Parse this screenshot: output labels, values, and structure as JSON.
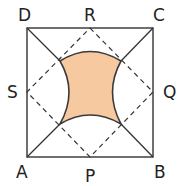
{
  "diagram": {
    "title": "",
    "labels": {
      "A": "A",
      "B": "B",
      "C": "C",
      "D": "D",
      "P": "P",
      "Q": "Q",
      "R": "R",
      "S": "S"
    },
    "colors": {
      "stroke": "#333333",
      "shaded_fill": "#f7c9a0",
      "shaded_stroke": "#3a3a3a"
    }
  }
}
